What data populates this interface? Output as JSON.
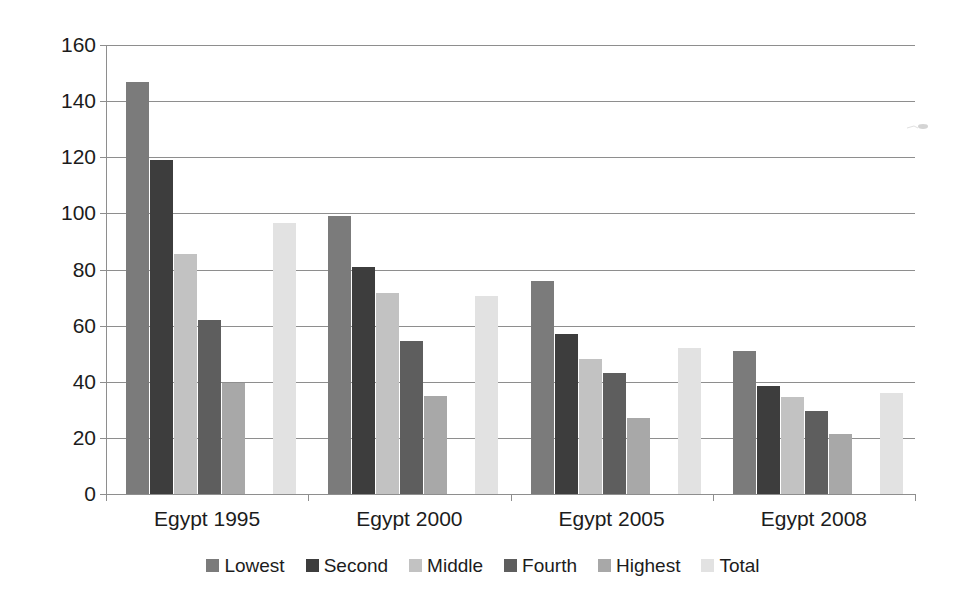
{
  "chart_data": {
    "type": "bar",
    "title": "",
    "subtitle": "",
    "xlabel": "",
    "ylabel": "",
    "categories": [
      "Egypt 1995",
      "Egypt 2000",
      "Egypt 2005",
      "Egypt 2008"
    ],
    "series": [
      {
        "name": "Lowest",
        "color": "#7b7b7b",
        "values": [
          147,
          99,
          76,
          51
        ]
      },
      {
        "name": "Second",
        "color": "#3d3d3d",
        "values": [
          119,
          81,
          57,
          38.5
        ]
      },
      {
        "name": "Middle",
        "color": "#c2c2c2",
        "values": [
          85.5,
          71.5,
          48,
          34.5
        ]
      },
      {
        "name": "Fourth",
        "color": "#5e5e5e",
        "values": [
          62,
          54.5,
          43,
          29.5
        ]
      },
      {
        "name": "Highest",
        "color": "#a8a8a8",
        "values": [
          39.5,
          35,
          27,
          21.5
        ]
      },
      {
        "name": "Total",
        "color": "#e2e2e2",
        "values": [
          96.5,
          70.5,
          52,
          36
        ]
      }
    ],
    "ylim": [
      0,
      160
    ],
    "ytick_step": 20,
    "yticks": [
      0,
      20,
      40,
      60,
      80,
      100,
      120,
      140,
      160
    ],
    "ytick_labels": [
      "0",
      "20",
      "40",
      "60",
      "80",
      "100",
      "120",
      "140",
      "160"
    ],
    "grid": true,
    "grid_axis": "y",
    "legend_position": "bottom",
    "legend_orientation": "horizontal",
    "gap_before_last_series": true,
    "axis_color": "#8e8e8e",
    "text_color": "#1c1c1c",
    "background": "#ffffff"
  }
}
